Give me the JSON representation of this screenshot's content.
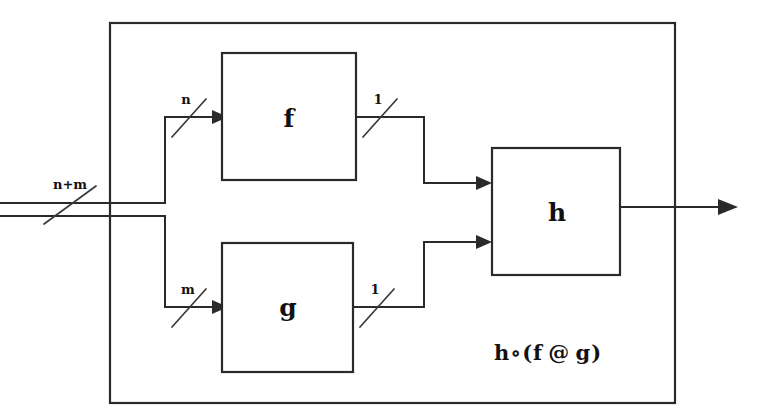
{
  "diagram": {
    "stroke_color": "#2a2a2a",
    "background_color": "#ffffff",
    "outer_block": {
      "name": "composite-block",
      "formula_label": "h∘(f @ g)"
    },
    "blocks": [
      {
        "id": "f",
        "label": "f"
      },
      {
        "id": "g",
        "label": "g"
      },
      {
        "id": "h",
        "label": "h"
      }
    ],
    "wire_labels": {
      "input": "n+m",
      "f_input": "n",
      "g_input": "m",
      "f_output": "1",
      "g_output": "1"
    }
  }
}
